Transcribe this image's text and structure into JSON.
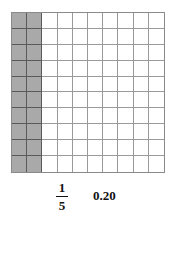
{
  "grid": {
    "rows": 10,
    "columns": 10,
    "shaded_columns": 2,
    "shaded_color": "#a9a9a9",
    "line_color": "#9a9a9a"
  },
  "labels": {
    "fraction_numerator": "1",
    "fraction_denominator": "5",
    "decimal": "0.20"
  }
}
